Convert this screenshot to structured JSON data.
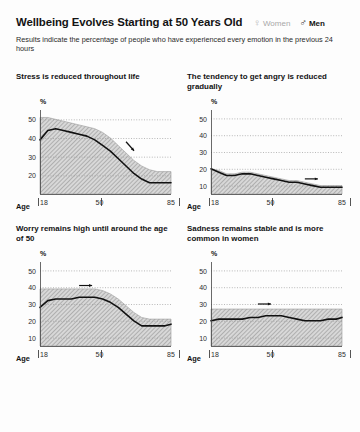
{
  "header": {
    "title": "Wellbeing Evolves Starting at 50 Years Old",
    "subtitle": "Results indicate the percentage of people who have experienced every emotion in the previous 24 hours",
    "legend": [
      {
        "symbol": "♀",
        "label": "Women",
        "color": "#a8a8a8"
      },
      {
        "symbol": "♂",
        "label": "Men",
        "color": "#131313"
      }
    ]
  },
  "axis": {
    "age_label": "Age",
    "x_ticks": [
      "18",
      "50",
      "85"
    ],
    "y_unit": "%"
  },
  "chart_data": [
    {
      "id": "stress",
      "type": "area",
      "title": "Stress is reduced throughout life",
      "xlabel": "Age",
      "ylabel": "%",
      "yticks": [
        50,
        40,
        30,
        20
      ],
      "ylim": [
        10,
        55
      ],
      "xlim": [
        18,
        85
      ],
      "x": [
        18,
        22,
        26,
        30,
        34,
        38,
        42,
        46,
        50,
        54,
        58,
        62,
        66,
        70,
        74,
        78,
        82,
        85
      ],
      "series": [
        {
          "name": "Men",
          "values": [
            39,
            44,
            45,
            44,
            43,
            42,
            41,
            39,
            36,
            33,
            29,
            25,
            21,
            18,
            16,
            16,
            16,
            16
          ]
        },
        {
          "name": "Women band upper",
          "values": [
            51,
            51,
            50,
            49,
            48,
            47,
            46,
            45,
            43,
            40,
            36,
            32,
            28,
            25,
            23,
            22,
            22,
            22
          ]
        }
      ],
      "annotation": {
        "type": "arrow",
        "direction": "down-right",
        "x": 62,
        "y": 38
      },
      "grid": true,
      "legend_position": "top"
    },
    {
      "id": "anger",
      "type": "area",
      "title": "The tendency to get angry is reduced gradually",
      "xlabel": "Age",
      "ylabel": "%",
      "yticks": [
        50,
        40,
        30,
        20,
        10
      ],
      "ylim": [
        5,
        55
      ],
      "xlim": [
        18,
        85
      ],
      "x": [
        18,
        22,
        26,
        30,
        34,
        38,
        42,
        46,
        50,
        54,
        58,
        62,
        66,
        70,
        74,
        78,
        82,
        85
      ],
      "series": [
        {
          "name": "Men",
          "values": [
            20,
            18,
            16,
            16,
            17,
            17,
            16,
            15,
            14,
            13,
            12,
            12,
            11,
            10,
            9,
            9,
            9,
            9
          ]
        },
        {
          "name": "Women band upper",
          "values": [
            20,
            19,
            17,
            17,
            18,
            18,
            17,
            16,
            15,
            14,
            13,
            13,
            12,
            11,
            10,
            10,
            10,
            10
          ]
        }
      ],
      "annotation": {
        "type": "arrow",
        "direction": "right",
        "x": 66,
        "y": 14
      },
      "grid": true,
      "legend_position": "top"
    },
    {
      "id": "worry",
      "type": "area",
      "title": "Worry remains high until around the age of 50",
      "xlabel": "Age",
      "ylabel": "%",
      "yticks": [
        50,
        40,
        30,
        20,
        10
      ],
      "ylim": [
        5,
        55
      ],
      "xlim": [
        18,
        85
      ],
      "x": [
        18,
        22,
        26,
        30,
        34,
        38,
        42,
        46,
        50,
        54,
        58,
        62,
        66,
        70,
        74,
        78,
        82,
        85
      ],
      "series": [
        {
          "name": "Men",
          "values": [
            28,
            32,
            33,
            33,
            33,
            34,
            34,
            34,
            33,
            31,
            28,
            24,
            20,
            17,
            17,
            17,
            17,
            18
          ]
        },
        {
          "name": "Women band upper",
          "values": [
            39,
            39,
            39,
            39,
            39,
            39,
            39,
            39,
            38,
            36,
            33,
            29,
            25,
            22,
            21,
            21,
            21,
            21
          ]
        }
      ],
      "annotation": {
        "type": "arrow",
        "direction": "right",
        "x": 38,
        "y": 41
      },
      "grid": true,
      "legend_position": "top"
    },
    {
      "id": "sadness",
      "type": "area",
      "title": "Sadness remains stable and is more common in women",
      "xlabel": "Age",
      "ylabel": "%",
      "yticks": [
        50,
        40,
        30,
        20,
        10
      ],
      "ylim": [
        5,
        55
      ],
      "xlim": [
        18,
        85
      ],
      "x": [
        18,
        22,
        26,
        30,
        34,
        38,
        42,
        46,
        50,
        54,
        58,
        62,
        66,
        70,
        74,
        78,
        82,
        85
      ],
      "series": [
        {
          "name": "Men",
          "values": [
            20,
            21,
            21,
            21,
            21,
            22,
            22,
            23,
            23,
            23,
            22,
            21,
            20,
            20,
            20,
            21,
            21,
            22
          ]
        },
        {
          "name": "Women band upper",
          "values": [
            27,
            27,
            27,
            27,
            27,
            27,
            27,
            27,
            27,
            27,
            27,
            27,
            27,
            27,
            27,
            27,
            27,
            27
          ]
        }
      ],
      "annotation": {
        "type": "arrow",
        "direction": "right",
        "x": 42,
        "y": 30
      },
      "grid": true,
      "legend_position": "top"
    }
  ]
}
